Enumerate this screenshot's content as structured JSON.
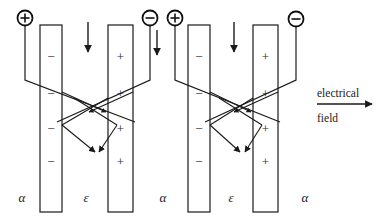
{
  "figure": {
    "type": "physics-diagram",
    "background_color": "#ffffff",
    "line_color": "#1a1a1a"
  },
  "terminals": [
    {
      "id": "t1",
      "symbol": "+",
      "cx": 25,
      "cy": 18,
      "r": 8
    },
    {
      "id": "t2",
      "symbol": "−",
      "cx": 150,
      "cy": 18,
      "r": 8
    },
    {
      "id": "t3",
      "symbol": "+",
      "cx": 175,
      "cy": 18,
      "r": 8
    },
    {
      "id": "t4",
      "symbol": "−",
      "cx": 296,
      "cy": 19,
      "r": 8
    }
  ],
  "plates": [
    {
      "id": "plate-1",
      "x": 40,
      "y": 25,
      "width": 22,
      "height": 187,
      "charge": "−",
      "signs_y": [
        58,
        95,
        130,
        163
      ]
    },
    {
      "id": "plate-2",
      "x": 108,
      "y": 25,
      "width": 25,
      "height": 187,
      "charge": "+",
      "signs_y": [
        58,
        95,
        130,
        163
      ]
    },
    {
      "id": "plate-3",
      "x": 188,
      "y": 25,
      "width": 22,
      "height": 187,
      "charge": "−",
      "signs_y": [
        58,
        95,
        130,
        163
      ]
    },
    {
      "id": "plate-4",
      "x": 253,
      "y": 25,
      "width": 25,
      "height": 187,
      "charge": "+",
      "signs_y": [
        58,
        95,
        130,
        163
      ]
    }
  ],
  "region_labels": [
    {
      "id": "alpha-1",
      "text": "α",
      "x": 22,
      "y": 202
    },
    {
      "id": "epsilon-1",
      "text": "ε",
      "x": 86,
      "y": 202
    },
    {
      "id": "alpha-2",
      "text": "α",
      "x": 163,
      "y": 202
    },
    {
      "id": "epsilon-2",
      "text": "ε",
      "x": 231,
      "y": 202
    },
    {
      "id": "alpha-3",
      "text": "α",
      "x": 305,
      "y": 202
    }
  ],
  "field_arrows": [
    {
      "id": "field-arrow-1",
      "x": 88,
      "y_start": 22,
      "y_end": 57
    },
    {
      "id": "field-arrow-2",
      "x": 157,
      "y_start": 30,
      "y_end": 60
    },
    {
      "id": "field-arrow-3",
      "x": 234,
      "y_start": 22,
      "y_end": 57
    }
  ],
  "electrical_field_annotation": {
    "line1": "electrical",
    "line2": "field",
    "arrow_x_start": 317,
    "arrow_x_end": 377,
    "arrow_y": 103,
    "label1_x": 317,
    "label1_y": 97,
    "label2_x": 317,
    "label2_y": 122
  },
  "cells": [
    {
      "id": "cell-1",
      "wire_left": "M25,26 L25,80 L135,122",
      "wire_right": "M150,26 L150,80 L57,122",
      "cross_center_x": 96,
      "cross_center_y": 112,
      "v_apex_x": 96,
      "v_apex_y": 153
    },
    {
      "id": "cell-2",
      "wire_left": "M175,26 L175,80 L280,122",
      "wire_right": "M296,27 L296,80 L205,122",
      "cross_center_x": 241,
      "cross_center_y": 112,
      "v_apex_x": 241,
      "v_apex_y": 153
    }
  ]
}
